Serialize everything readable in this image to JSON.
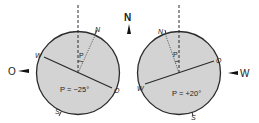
{
  "compass": {
    "north_label": "N",
    "left_direction_label": "O",
    "right_direction_label": "W"
  },
  "left_disk": {
    "labels": {
      "north": "N",
      "west": "W",
      "east": "O",
      "south": "S",
      "angle_symbol": "P"
    },
    "angle_text": "P = −25°",
    "angle_deg": -25
  },
  "right_disk": {
    "labels": {
      "north": "N",
      "west": "W",
      "east": "O",
      "south": "S",
      "angle_symbol": "P"
    },
    "angle_text": "P = +20°",
    "angle_deg": 20
  },
  "colors": {
    "disk_fill": "#d3d3d3",
    "line": "#2a2a2a",
    "background": "#ffffff"
  }
}
